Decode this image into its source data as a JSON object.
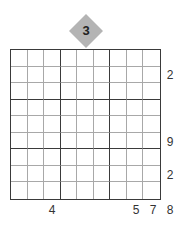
{
  "puzzle": {
    "type": "skyscraper-sudoku",
    "size": 9,
    "top_badge": "3",
    "colors": {
      "badge_fill": "#b4b4b4",
      "thick_line": "#3a3a3a",
      "thin_line": "#a8a8a8"
    },
    "right_clues": [
      {
        "row": 2,
        "value": "2"
      },
      {
        "row": 6,
        "value": "9"
      },
      {
        "row": 8,
        "value": "2"
      }
    ],
    "bottom_clues": [
      {
        "col": 3,
        "value": "4"
      },
      {
        "col": 8,
        "value": "5"
      },
      {
        "col": 9,
        "value": "7"
      }
    ],
    "corner_clue": "8"
  }
}
